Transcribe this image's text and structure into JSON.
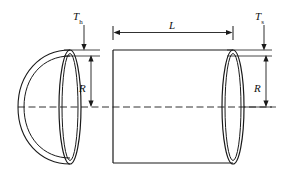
{
  "figure": {
    "type": "engineering-diagram",
    "background_color": "#ffffff",
    "line_color": "#1a1a1a"
  },
  "labels": {
    "head_thickness": {
      "symbol": "T",
      "subscript": "h",
      "meaning": "head thickness"
    },
    "shell_thickness": {
      "symbol": "T",
      "subscript": "s",
      "meaning": "shell thickness"
    },
    "length": {
      "symbol": "L",
      "meaning": "shell length"
    },
    "radius_head": {
      "symbol": "R",
      "meaning": "inside radius at head"
    },
    "radius_shell": {
      "symbol": "R",
      "meaning": "inside radius at shell"
    }
  },
  "geometry": {
    "centerline_y": 107,
    "centerline_x_start": 18,
    "centerline_x_end": 272,
    "shell_left_x": 113,
    "shell_right_x": 233,
    "shell_top_y": 50,
    "shell_bottom_y": 163,
    "head_apex_x": 20,
    "head_join_x": 70,
    "length_dim_y": 32,
    "head_ellipse_cx": 70,
    "shell_ellipse_cx": 233,
    "ellipse_ry": 57,
    "ellipse_rx_outer": 11,
    "ellipse_rx_inner": 8
  }
}
